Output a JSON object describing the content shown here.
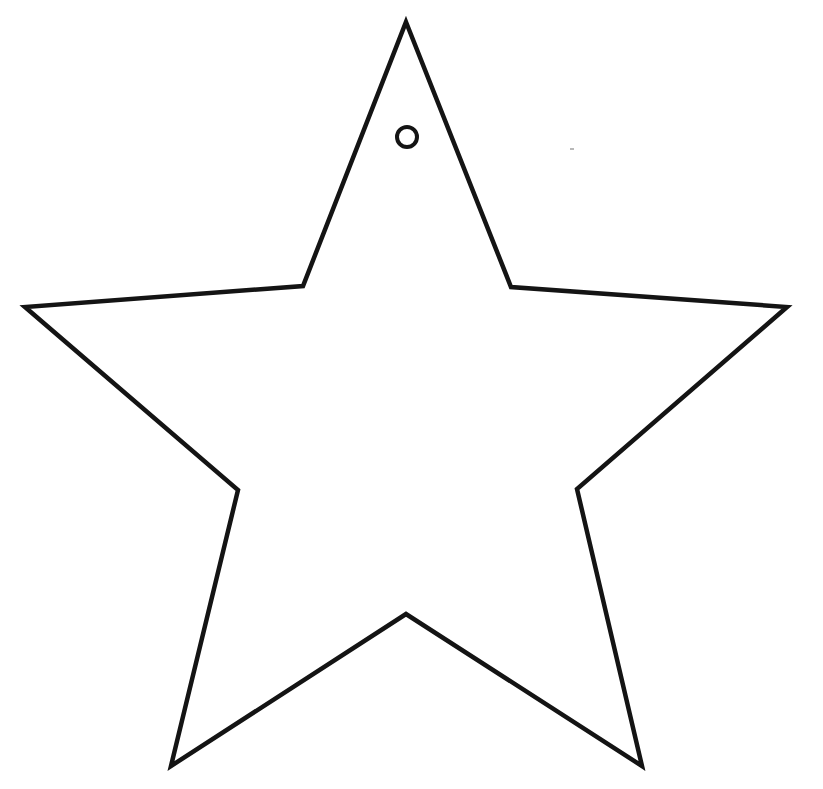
{
  "image": {
    "width": 823,
    "height": 789,
    "background_color": "#ffffff",
    "title": "Star ornament template"
  },
  "star": {
    "shape": "five-point-star",
    "stroke_color": "#141414",
    "fill_color": "#ffffff",
    "stroke_width": 4.5,
    "points": "406,22 511,287 787,307 577,489 642,766 406,614 171,766 238,490 25,307 303,286"
  },
  "hole": {
    "cx": 407,
    "cy": 137,
    "r": 10,
    "stroke_color": "#141414"
  },
  "speck": {
    "x": 570,
    "y": 148,
    "width": 4,
    "height": 2
  }
}
